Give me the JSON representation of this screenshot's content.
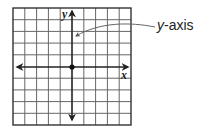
{
  "diagram": {
    "grid": {
      "columns": 10,
      "rows": 10,
      "line_color": "#555555",
      "border_color": "#333333"
    },
    "axes": {
      "x_label": "x",
      "y_label": "y",
      "origin_marker": "dot",
      "color": "#222222"
    },
    "callout": {
      "variable": "y",
      "suffix": "-axis",
      "points_to": "y-axis",
      "arrow_color": "#666666"
    }
  }
}
